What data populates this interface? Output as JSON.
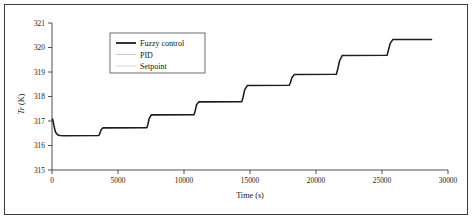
{
  "figure": {
    "has_outer_frame": true,
    "background_color": "#ffffff"
  },
  "chart_data": {
    "type": "line",
    "title": "",
    "xlabel": "Time (s)",
    "ylabel": "Tr (K)",
    "ylabel_italic_part": "Tr",
    "ylabel_plain_part": " (K)",
    "xlim": [
      0,
      30000
    ],
    "ylim": [
      315,
      321
    ],
    "xticks": [
      0,
      5000,
      10000,
      15000,
      20000,
      25000,
      30000
    ],
    "xtick_labels": [
      "0",
      "5000",
      "10000",
      "15000",
      "20000",
      "25000",
      "30000"
    ],
    "yticks": [
      315,
      316,
      317,
      318,
      319,
      320,
      321
    ],
    "ytick_labels": [
      "315",
      "316",
      "317",
      "318",
      "319",
      "320",
      "321"
    ],
    "grid": false,
    "legend_position": "upper-left-inside",
    "legend": [
      {
        "label": "Fuzzy control",
        "color": "#1c1c1c",
        "width": "thick",
        "style": "solid"
      },
      {
        "label": "PID",
        "color": "#bdbdbd",
        "width": "thin",
        "style": "solid"
      },
      {
        "label": "Setpoint",
        "color": "#cacaca",
        "width": "thin",
        "style": "solid"
      }
    ],
    "series": [
      {
        "name": "Fuzzy control",
        "color": "#1c1c1c",
        "x": [
          0,
          60,
          150,
          260,
          420,
          600,
          900,
          3550,
          3620,
          3720,
          3860,
          7180,
          7260,
          7360,
          7520,
          10760,
          10840,
          10950,
          11120,
          14380,
          14470,
          14600,
          14800,
          17980,
          18070,
          18180,
          18360,
          21540,
          21640,
          21780,
          21980,
          25380,
          25480,
          25620,
          25830,
          28800
        ],
        "y": [
          317.1,
          317.05,
          316.8,
          316.55,
          316.44,
          316.41,
          316.4,
          316.41,
          316.48,
          316.64,
          316.72,
          316.73,
          316.84,
          317.1,
          317.25,
          317.26,
          317.4,
          317.66,
          317.78,
          317.79,
          317.96,
          318.28,
          318.45,
          318.46,
          318.58,
          318.78,
          318.9,
          318.91,
          319.1,
          319.45,
          319.67,
          319.68,
          319.88,
          320.17,
          320.33,
          320.33
        ]
      },
      {
        "name": "PID",
        "color": "#bdbdbd",
        "x": [],
        "y": []
      },
      {
        "name": "Setpoint",
        "color": "#cacaca",
        "x": [],
        "y": []
      }
    ],
    "step_plateaus": [
      {
        "start_time": 600,
        "end_time": 3550,
        "value": 316.4
      },
      {
        "start_time": 3860,
        "end_time": 7180,
        "value": 316.72
      },
      {
        "start_time": 7520,
        "end_time": 10760,
        "value": 317.25
      },
      {
        "start_time": 11120,
        "end_time": 14380,
        "value": 317.78
      },
      {
        "start_time": 14800,
        "end_time": 17980,
        "value": 318.45
      },
      {
        "start_time": 18360,
        "end_time": 21540,
        "value": 318.9
      },
      {
        "start_time": 21980,
        "end_time": 25380,
        "value": 319.67
      },
      {
        "start_time": 25830,
        "end_time": 28800,
        "value": 320.33
      }
    ]
  }
}
